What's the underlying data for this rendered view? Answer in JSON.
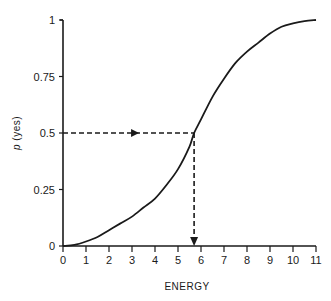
{
  "chart_data": {
    "type": "line",
    "title": "",
    "xlabel": "ENERGY",
    "ylabel": "p (yes)",
    "ylabel_italic_part": "p",
    "ylabel_rest": " (yes)",
    "xlim": [
      0,
      11
    ],
    "ylim": [
      0,
      1
    ],
    "grid": false,
    "legend": null,
    "x_ticks": [
      "0",
      "1",
      "2",
      "3",
      "4",
      "5",
      "6",
      "7",
      "8",
      "9",
      "10",
      "11"
    ],
    "y_ticks": [
      "0",
      "0.25",
      "0.5",
      "0.75",
      "1"
    ],
    "series": [
      {
        "name": "psychometric curve",
        "x": [
          0,
          0.5,
          1,
          1.5,
          2,
          2.5,
          3,
          3.5,
          4,
          4.5,
          5,
          5.5,
          5.7,
          6,
          6.5,
          7,
          7.5,
          8,
          8.5,
          9,
          9.5,
          10,
          10.5,
          11
        ],
        "y": [
          0,
          0.005,
          0.02,
          0.04,
          0.07,
          0.1,
          0.13,
          0.17,
          0.21,
          0.27,
          0.34,
          0.44,
          0.5,
          0.56,
          0.66,
          0.74,
          0.81,
          0.86,
          0.9,
          0.94,
          0.97,
          0.985,
          0.995,
          1.0
        ]
      }
    ],
    "annotations": [
      {
        "type": "dashed-arrow",
        "from": [
          0,
          0.5
        ],
        "to": [
          5.7,
          0.5
        ],
        "description": "horizontal dashed line at p=0.5 with arrow pointing right"
      },
      {
        "type": "dashed-arrow",
        "from": [
          5.7,
          0.5
        ],
        "to": [
          5.7,
          0
        ],
        "description": "vertical dashed line down to energy axis with arrowhead"
      }
    ],
    "threshold": {
      "energy": 5.7,
      "p": 0.5
    }
  },
  "colors": {
    "ink": "#1a1a1a",
    "background": "#ffffff"
  }
}
